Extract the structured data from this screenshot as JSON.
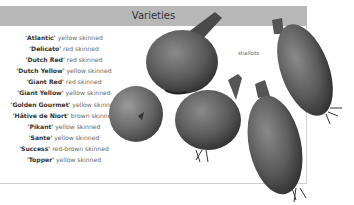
{
  "header": {
    "title": "Varieties"
  },
  "varieties": [
    {
      "name": "'Atlantic'",
      "desc": " yellow skinned"
    },
    {
      "name": "'Delicato'",
      "desc": " red skinned"
    },
    {
      "name": "'Dutch Red'",
      "desc": " red skinned"
    },
    {
      "name": "'Dutch Yellow'",
      "desc": " yellow skinned"
    },
    {
      "name": "'Giant Red'",
      "desc": " red skinned"
    },
    {
      "name": "'Giant Yellow'",
      "desc": " yellow skinned"
    },
    {
      "name": "'Golden Gourmet'",
      "desc": " yellow skinned"
    },
    {
      "name": "'Hâtive de Niort'",
      "desc": " brown skinned"
    },
    {
      "name": "'Pikant'",
      "desc": " yellow skinned"
    },
    {
      "name": "'Sante'",
      "desc": " yellow skinned"
    },
    {
      "name": "'Success'",
      "desc": " red-brown skinned"
    },
    {
      "name": "'Topper'",
      "desc": " yellow skinned"
    }
  ],
  "image": {
    "label": "shallots"
  },
  "colors": {
    "header_bg": "#b8b8b8",
    "frame_border": "#cfcfcf"
  }
}
